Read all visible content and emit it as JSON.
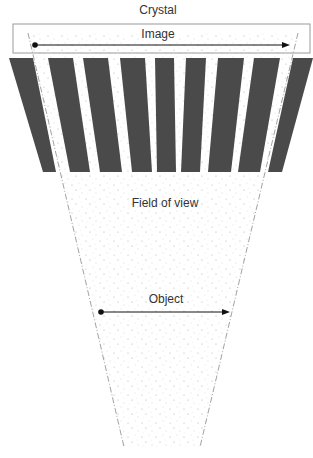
{
  "labels": {
    "crystal": "Crystal",
    "image": "Image",
    "field_of_view": "Field of view",
    "object": "Object"
  },
  "colors": {
    "bar": "#4a4a4a",
    "box_stroke": "#9a9a9a",
    "dashed": "#8a8a8a",
    "arrow": "#111111",
    "speckle": "#b0b0b0",
    "text": "#333333"
  },
  "collimator_bars": [
    {
      "top": [
        9,
        33
      ],
      "bottom": [
        43,
        56
      ]
    },
    {
      "top": [
        48,
        73
      ],
      "bottom": [
        70,
        90
      ]
    },
    {
      "top": [
        83,
        108
      ],
      "bottom": [
        100,
        122
      ]
    },
    {
      "top": [
        120,
        145
      ],
      "bottom": [
        132,
        152
      ]
    },
    {
      "top": [
        155,
        174
      ],
      "bottom": [
        157,
        176
      ]
    },
    {
      "top": [
        186,
        206
      ],
      "bottom": [
        181,
        200
      ]
    },
    {
      "top": [
        218,
        244
      ],
      "bottom": [
        208,
        231
      ]
    },
    {
      "top": [
        254,
        280
      ],
      "bottom": [
        238,
        260
      ]
    },
    {
      "top": [
        293,
        313
      ],
      "bottom": [
        268,
        282
      ]
    }
  ],
  "image_arrow": {
    "x1": 35,
    "x2": 290,
    "y": 45
  },
  "object_arrow": {
    "x1": 101,
    "x2": 230,
    "y": 312
  },
  "field_of_view_cone": {
    "top_left": [
      28,
      33
    ],
    "top_right": [
      298,
      33
    ],
    "bottom_left": [
      124,
      447
    ],
    "bottom_right": [
      200,
      447
    ]
  }
}
